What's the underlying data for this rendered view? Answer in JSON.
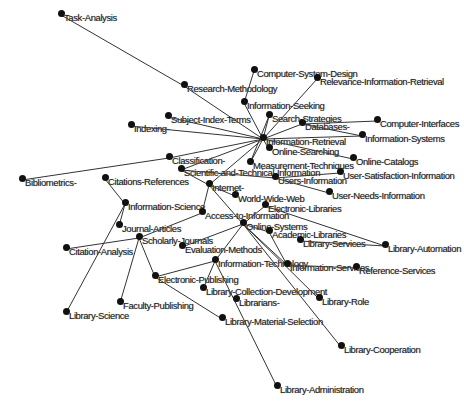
{
  "diagram": {
    "type": "network-graph",
    "edge_color": "#333333",
    "node_color": "#111111",
    "nodes": [
      {
        "id": "task",
        "label": "Task-Analysis",
        "x": 58,
        "y": 12
      },
      {
        "id": "resmeth",
        "label": "Research-Methodology",
        "x": 181,
        "y": 83
      },
      {
        "id": "csd",
        "label": "Computer-System-Design",
        "x": 251,
        "y": 68
      },
      {
        "id": "rir",
        "label": "Relevance-Information-Retrieval",
        "x": 314,
        "y": 76
      },
      {
        "id": "iseek",
        "label": "Information-Seeking",
        "x": 241,
        "y": 100
      },
      {
        "id": "sst",
        "label": "Search-Strategies",
        "x": 266,
        "y": 113
      },
      {
        "id": "sit",
        "label": "Subject-Index-Terms",
        "x": 165,
        "y": 114
      },
      {
        "id": "idx",
        "label": "Indexing-",
        "x": 128,
        "y": 123
      },
      {
        "id": "db",
        "label": "Databases-",
        "x": 299,
        "y": 121
      },
      {
        "id": "ci",
        "label": "Computer-Interfaces",
        "x": 374,
        "y": 118
      },
      {
        "id": "ir",
        "label": "Information-Retrieval",
        "x": 260,
        "y": 136
      },
      {
        "id": "is",
        "label": "Information-Systems",
        "x": 359,
        "y": 133
      },
      {
        "id": "os",
        "label": "Online-Searching",
        "x": 266,
        "y": 146
      },
      {
        "id": "oc",
        "label": "Online-Catalogs",
        "x": 350,
        "y": 156
      },
      {
        "id": "cls",
        "label": "Classification-",
        "x": 166,
        "y": 155
      },
      {
        "id": "mt",
        "label": "Measurement-Techniques",
        "x": 247,
        "y": 160
      },
      {
        "id": "sti",
        "label": "Scientific-and-Technical-Information",
        "x": 178,
        "y": 167
      },
      {
        "id": "bib",
        "label": "Bibliometrics-",
        "x": 19,
        "y": 177
      },
      {
        "id": "cr",
        "label": "Citations-References",
        "x": 102,
        "y": 176
      },
      {
        "id": "usi",
        "label": "User-Satisfaction-Information",
        "x": 337,
        "y": 170
      },
      {
        "id": "ui",
        "label": "Users-Information",
        "x": 272,
        "y": 175
      },
      {
        "id": "inet",
        "label": "Internet-",
        "x": 206,
        "y": 182
      },
      {
        "id": "uni",
        "label": "User-Needs-Information",
        "x": 326,
        "y": 190
      },
      {
        "id": "www",
        "label": "World-Wide-Web",
        "x": 232,
        "y": 193
      },
      {
        "id": "el",
        "label": "Electronic-Libraries",
        "x": 262,
        "y": 203
      },
      {
        "id": "isci",
        "label": "Information-Science",
        "x": 122,
        "y": 201
      },
      {
        "id": "ati",
        "label": "Access-to-Information",
        "x": 199,
        "y": 210
      },
      {
        "id": "osys",
        "label": "Online-Systems",
        "x": 240,
        "y": 221
      },
      {
        "id": "ja",
        "label": "Journal-Articles",
        "x": 116,
        "y": 223
      },
      {
        "id": "al",
        "label": "Academic-Libraries",
        "x": 266,
        "y": 229
      },
      {
        "id": "sj",
        "label": "Scholarly-Journals",
        "x": 136,
        "y": 235
      },
      {
        "id": "ls",
        "label": "Library-Services",
        "x": 297,
        "y": 238
      },
      {
        "id": "la",
        "label": "Library-Automation",
        "x": 382,
        "y": 243
      },
      {
        "id": "em",
        "label": "Evaluation-Methods",
        "x": 179,
        "y": 244
      },
      {
        "id": "ca",
        "label": "Citation-Analysis",
        "x": 63,
        "y": 246
      },
      {
        "id": "it",
        "label": "Information-Technology",
        "x": 212,
        "y": 258
      },
      {
        "id": "isrv",
        "label": "Information-Services",
        "x": 284,
        "y": 262
      },
      {
        "id": "rs",
        "label": "Reference-Services",
        "x": 353,
        "y": 265
      },
      {
        "id": "ep",
        "label": "Electronic-Publishing",
        "x": 152,
        "y": 274
      },
      {
        "id": "lcd",
        "label": "Library-Collection-Development",
        "x": 200,
        "y": 286
      },
      {
        "id": "lib",
        "label": "Librarians-",
        "x": 233,
        "y": 297
      },
      {
        "id": "lr",
        "label": "Library-Role",
        "x": 316,
        "y": 296
      },
      {
        "id": "fp",
        "label": "Faculty-Publishing",
        "x": 117,
        "y": 300
      },
      {
        "id": "lsci",
        "label": "Library-Science",
        "x": 63,
        "y": 310
      },
      {
        "id": "lms",
        "label": "Library-Material-Selection",
        "x": 219,
        "y": 316
      },
      {
        "id": "lcoop",
        "label": "Library-Cooperation",
        "x": 338,
        "y": 344
      },
      {
        "id": "ladm",
        "label": "Library-Administration",
        "x": 274,
        "y": 384
      }
    ],
    "edges": [
      [
        "task",
        "resmeth"
      ],
      [
        "resmeth",
        "ir"
      ],
      [
        "csd",
        "iseek"
      ],
      [
        "rir",
        "ir"
      ],
      [
        "iseek",
        "ir"
      ],
      [
        "sst",
        "ir"
      ],
      [
        "sit",
        "ir"
      ],
      [
        "idx",
        "ir"
      ],
      [
        "db",
        "ir"
      ],
      [
        "db",
        "ci"
      ],
      [
        "db",
        "is"
      ],
      [
        "ir",
        "is"
      ],
      [
        "ir",
        "oc"
      ],
      [
        "ir",
        "cls"
      ],
      [
        "ir",
        "mt"
      ],
      [
        "ir",
        "sti"
      ],
      [
        "ir",
        "inet"
      ],
      [
        "ir",
        "os"
      ],
      [
        "cls",
        "bib"
      ],
      [
        "cr",
        "isci"
      ],
      [
        "isci",
        "ja"
      ],
      [
        "isci",
        "lsci"
      ],
      [
        "sj",
        "ca"
      ],
      [
        "sj",
        "fp"
      ],
      [
        "sj",
        "ep"
      ],
      [
        "sj",
        "ati"
      ],
      [
        "inet",
        "ati"
      ],
      [
        "inet",
        "osys"
      ],
      [
        "sti",
        "inet"
      ],
      [
        "sti",
        "ui"
      ],
      [
        "ui",
        "usi"
      ],
      [
        "ui",
        "uni"
      ],
      [
        "www",
        "inet"
      ],
      [
        "el",
        "la"
      ],
      [
        "el",
        "osys"
      ],
      [
        "osys",
        "al"
      ],
      [
        "osys",
        "em"
      ],
      [
        "osys",
        "it"
      ],
      [
        "osys",
        "isrv"
      ],
      [
        "osys",
        "lr"
      ],
      [
        "osys",
        "lcoop"
      ],
      [
        "al",
        "isrv"
      ],
      [
        "isrv",
        "rs"
      ],
      [
        "ls",
        "la"
      ],
      [
        "it",
        "ep"
      ],
      [
        "it",
        "lcd"
      ],
      [
        "it",
        "ladm"
      ],
      [
        "ep",
        "lms"
      ],
      [
        "sst",
        "mt"
      ]
    ]
  }
}
